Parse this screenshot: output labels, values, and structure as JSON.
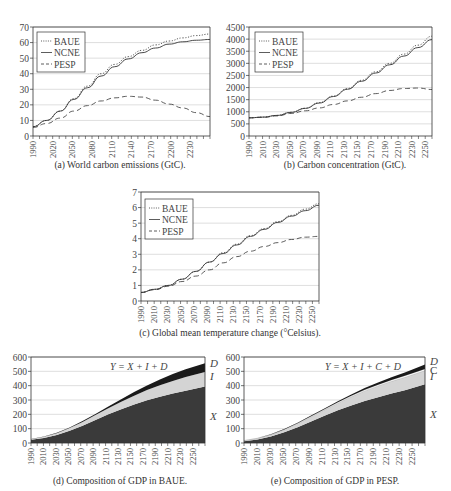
{
  "chart_data": [
    {
      "id": "a",
      "type": "line",
      "title": "(a) World carbon emissions (GtC).",
      "xlabel": "",
      "ylabel": "",
      "ylim": [
        0,
        70
      ],
      "yticks": [
        0,
        10,
        20,
        30,
        40,
        50,
        60,
        70
      ],
      "xlim": [
        1990,
        2250
      ],
      "xtick_labels": [
        "1990",
        "2020",
        "2050",
        "2080",
        "2110",
        "2140",
        "2170",
        "2200",
        "2230"
      ],
      "grid": true,
      "legend_position": "upper-left",
      "x": [
        1990,
        2010,
        2030,
        2050,
        2070,
        2090,
        2110,
        2130,
        2150,
        2170,
        2190,
        2210,
        2230,
        2250
      ],
      "series": [
        {
          "name": "BAUE",
          "style": "dotted",
          "values": [
            6,
            10,
            16,
            24,
            32,
            40,
            46,
            51,
            55,
            58.5,
            61,
            63,
            64.5,
            65.5
          ]
        },
        {
          "name": "NCNE",
          "style": "solid",
          "values": [
            6,
            10,
            16,
            23.5,
            31,
            38.5,
            44.5,
            49.5,
            53.5,
            56.5,
            59,
            60.5,
            61.5,
            62
          ]
        },
        {
          "name": "PESP",
          "style": "dashed",
          "values": [
            5.5,
            8,
            11.5,
            16,
            19.5,
            22.5,
            24.5,
            25.5,
            25,
            23,
            20.5,
            18,
            15,
            12.5
          ]
        }
      ]
    },
    {
      "id": "b",
      "type": "line",
      "title": "(b) Carbon concentration (GtC).",
      "xlabel": "",
      "ylabel": "",
      "ylim": [
        0,
        4500
      ],
      "yticks": [
        0,
        500,
        1000,
        1500,
        2000,
        2500,
        3000,
        3500,
        4000,
        4500
      ],
      "xlim": [
        1990,
        2250
      ],
      "xtick_labels": [
        "1990",
        "2010",
        "2030",
        "2050",
        "2070",
        "2090",
        "2110",
        "2130",
        "2150",
        "2170",
        "2190",
        "2210",
        "2230",
        "2250"
      ],
      "grid": true,
      "legend_position": "upper-left",
      "x": [
        1990,
        2010,
        2030,
        2050,
        2070,
        2090,
        2110,
        2130,
        2150,
        2170,
        2190,
        2210,
        2230,
        2250
      ],
      "series": [
        {
          "name": "BAUE",
          "style": "dotted",
          "values": [
            750,
            780,
            850,
            980,
            1150,
            1380,
            1650,
            1960,
            2300,
            2650,
            3000,
            3380,
            3750,
            4120
          ]
        },
        {
          "name": "NCNE",
          "style": "solid",
          "values": [
            750,
            780,
            850,
            975,
            1140,
            1360,
            1630,
            1930,
            2260,
            2600,
            2940,
            3300,
            3650,
            3980
          ]
        },
        {
          "name": "PESP",
          "style": "dashed",
          "values": [
            750,
            770,
            830,
            930,
            1040,
            1160,
            1300,
            1450,
            1600,
            1750,
            1880,
            1960,
            1980,
            1920
          ]
        }
      ]
    },
    {
      "id": "c",
      "type": "line",
      "title": "(c) Global mean temperature change (°Celsius).",
      "xlabel": "",
      "ylabel": "",
      "ylim": [
        0,
        7
      ],
      "yticks": [
        0,
        1,
        2,
        3,
        4,
        5,
        6,
        7
      ],
      "xlim": [
        1990,
        2250
      ],
      "xtick_labels": [
        "1990",
        "2010",
        "2030",
        "2050",
        "2070",
        "2090",
        "2110",
        "2130",
        "2150",
        "2170",
        "2190",
        "2210",
        "2230",
        "2250"
      ],
      "grid": true,
      "legend_position": "upper-left",
      "x": [
        1990,
        2010,
        2030,
        2050,
        2070,
        2090,
        2110,
        2130,
        2150,
        2170,
        2190,
        2210,
        2230,
        2250
      ],
      "series": [
        {
          "name": "BAUE",
          "style": "dotted",
          "values": [
            0.55,
            0.75,
            1.0,
            1.4,
            1.9,
            2.5,
            3.1,
            3.65,
            4.2,
            4.65,
            5.1,
            5.5,
            5.9,
            6.25
          ]
        },
        {
          "name": "NCNE",
          "style": "solid",
          "values": [
            0.55,
            0.75,
            1.0,
            1.4,
            1.9,
            2.5,
            3.05,
            3.6,
            4.15,
            4.6,
            5.05,
            5.45,
            5.8,
            6.15
          ]
        },
        {
          "name": "PESP",
          "style": "dashed",
          "values": [
            0.55,
            0.72,
            0.95,
            1.25,
            1.6,
            2.0,
            2.45,
            2.85,
            3.2,
            3.5,
            3.75,
            3.95,
            4.1,
            4.15
          ]
        }
      ]
    },
    {
      "id": "d",
      "type": "area",
      "title": "(d) Composition of GDP in BAUE.",
      "annotation": "Y = X + I + D",
      "xlabel": "",
      "ylabel": "",
      "ylim": [
        0,
        600
      ],
      "yticks": [
        0,
        100,
        200,
        300,
        400,
        500,
        600
      ],
      "xlim": [
        1990,
        2260
      ],
      "xtick_labels": [
        "1990",
        "2010",
        "2030",
        "2050",
        "2070",
        "2090",
        "2110",
        "2130",
        "2150",
        "2170",
        "2190",
        "2210",
        "2230",
        "2250"
      ],
      "grid": true,
      "stacked": true,
      "x": [
        1990,
        2010,
        2030,
        2050,
        2070,
        2090,
        2110,
        2130,
        2150,
        2170,
        2190,
        2210,
        2230,
        2260
      ],
      "series": [
        {
          "name": "X",
          "color": "#3a3a3a",
          "values": [
            22,
            35,
            55,
            85,
            120,
            160,
            200,
            235,
            268,
            298,
            323,
            345,
            365,
            395
          ]
        },
        {
          "name": "I",
          "color": "#d4d4d4",
          "values": [
            5,
            8,
            13,
            20,
            27,
            35,
            42,
            52,
            62,
            72,
            80,
            88,
            95,
            100
          ]
        },
        {
          "name": "D",
          "color": "#1a1a1a",
          "values": [
            1,
            2,
            3,
            4,
            6,
            8,
            12,
            18,
            25,
            32,
            40,
            48,
            55,
            62
          ]
        }
      ],
      "series_labels": [
        "D",
        "I",
        "X"
      ]
    },
    {
      "id": "e",
      "type": "area",
      "title": "(e) Composition of GDP in PESP.",
      "annotation": "Y = X + I + C + D",
      "xlabel": "",
      "ylabel": "",
      "ylim": [
        0,
        600
      ],
      "yticks": [
        0,
        100,
        200,
        300,
        400,
        500,
        600
      ],
      "xlim": [
        1990,
        2260
      ],
      "xtick_labels": [
        "1990",
        "2010",
        "2030",
        "2050",
        "2070",
        "2090",
        "2110",
        "2130",
        "2150",
        "2170",
        "2190",
        "2210",
        "2230",
        "2250"
      ],
      "grid": true,
      "stacked": true,
      "x": [
        1990,
        2010,
        2030,
        2050,
        2070,
        2090,
        2110,
        2130,
        2150,
        2170,
        2190,
        2210,
        2230,
        2260
      ],
      "series": [
        {
          "name": "X",
          "color": "#3a3a3a",
          "values": [
            12,
            25,
            45,
            75,
            110,
            150,
            190,
            228,
            262,
            293,
            320,
            345,
            368,
            410
          ]
        },
        {
          "name": "I",
          "color": "#d4d4d4",
          "values": [
            4,
            7,
            12,
            18,
            25,
            32,
            40,
            50,
            60,
            70,
            78,
            85,
            90,
            95
          ]
        },
        {
          "name": "C",
          "color": "#ffffff",
          "values": [
            1,
            1,
            2,
            2,
            3,
            4,
            5,
            6,
            7,
            8,
            9,
            10,
            11,
            12
          ]
        },
        {
          "name": "D",
          "color": "#1a1a1a",
          "values": [
            1,
            1,
            2,
            3,
            4,
            5,
            6,
            8,
            10,
            12,
            15,
            18,
            22,
            30
          ]
        }
      ],
      "series_labels": [
        "D",
        "C",
        "I",
        "X"
      ]
    }
  ],
  "captions": {
    "a": "(a) World carbon emissions (GtC).",
    "b": "(b) Carbon concentration (GtC).",
    "c": "(c) Global mean temperature change (°Celsius).",
    "d": "(d) Composition of GDP in BAUE.",
    "e": "(e) Composition of GDP in PESP."
  }
}
